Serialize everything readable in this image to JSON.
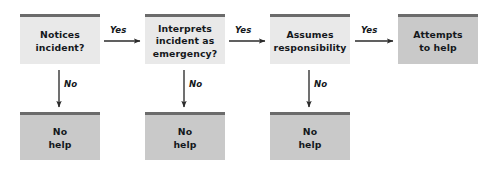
{
  "diagram": {
    "colors": {
      "box_light": "#e9e9e9",
      "box_dark": "#c9c9c9",
      "accent_bar": "#6b6b6b",
      "text": "#15181c",
      "arrow": "#2b2b2b",
      "background": "#ffffff"
    },
    "decision_nodes": [
      {
        "id": "notices",
        "line1": "Notices",
        "line2": "incident?",
        "line3": "",
        "style": "light",
        "x": 20,
        "y": 14,
        "w": 80,
        "h": 50
      },
      {
        "id": "interprets",
        "line1": "Interprets",
        "line2": "incident as",
        "line3": "emergency?",
        "style": "light",
        "x": 145,
        "y": 14,
        "w": 80,
        "h": 50
      },
      {
        "id": "assumes",
        "line1": "Assumes",
        "line2": "responsibility",
        "line3": "",
        "style": "light",
        "x": 270,
        "y": 14,
        "w": 80,
        "h": 50
      }
    ],
    "outcome_node": {
      "id": "attempts",
      "line1": "Attempts",
      "line2": "to help",
      "line3": "",
      "style": "dark",
      "x": 398,
      "y": 14,
      "w": 80,
      "h": 50
    },
    "no_help_nodes": [
      {
        "id": "no-help-1",
        "line1": "No",
        "line2": "help",
        "line3": "",
        "style": "dark",
        "x": 20,
        "y": 112,
        "w": 80,
        "h": 48
      },
      {
        "id": "no-help-2",
        "line1": "No",
        "line2": "help",
        "line3": "",
        "style": "dark",
        "x": 145,
        "y": 112,
        "w": 80,
        "h": 48
      },
      {
        "id": "no-help-3",
        "line1": "No",
        "line2": "help",
        "line3": "",
        "style": "dark",
        "x": 270,
        "y": 112,
        "w": 80,
        "h": 48
      }
    ],
    "yes_arrows": [
      {
        "id": "yes-1",
        "label": "Yes",
        "x1": 104,
        "y1": 41,
        "x2": 140,
        "y2": 41,
        "label_x": 110,
        "label_y": 25
      },
      {
        "id": "yes-2",
        "label": "Yes",
        "x1": 229,
        "y1": 41,
        "x2": 265,
        "y2": 41,
        "label_x": 235,
        "label_y": 25
      },
      {
        "id": "yes-3",
        "label": "Yes",
        "x1": 355,
        "y1": 41,
        "x2": 393,
        "y2": 41,
        "label_x": 361,
        "label_y": 25
      }
    ],
    "no_arrows": [
      {
        "id": "no-1",
        "label": "No",
        "x1": 59,
        "y1": 70,
        "x2": 59,
        "y2": 107,
        "label_x": 64,
        "label_y": 79
      },
      {
        "id": "no-2",
        "label": "No",
        "x1": 184,
        "y1": 70,
        "x2": 184,
        "y2": 107,
        "label_x": 189,
        "label_y": 79
      },
      {
        "id": "no-3",
        "label": "No",
        "x1": 309,
        "y1": 70,
        "x2": 309,
        "y2": 107,
        "label_x": 314,
        "label_y": 79
      }
    ]
  }
}
